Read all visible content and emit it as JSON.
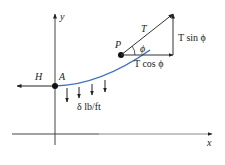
{
  "diagram": {
    "axes": {
      "x_label": "x",
      "y_label": "y"
    },
    "points": {
      "A": "A",
      "P": "P"
    },
    "forces": {
      "horizontal": "H",
      "tension": "T",
      "angle": "ϕ",
      "t_cos": "T cos ϕ",
      "t_sin": "T sin ϕ"
    },
    "load_label": "δ lb/ft",
    "colors": {
      "curve": "#3a6fc4",
      "ink": "#222222"
    }
  }
}
